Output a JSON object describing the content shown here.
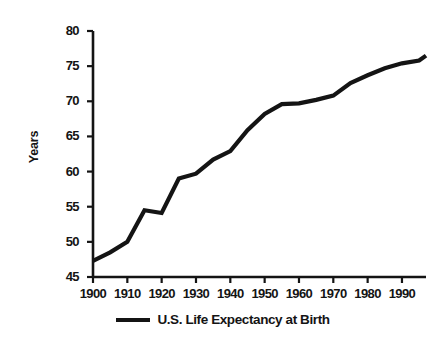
{
  "chart_data": {
    "type": "line",
    "title": "",
    "xlabel": "",
    "ylabel": "Years",
    "xlim": [
      1900,
      1997
    ],
    "ylim": [
      45,
      80
    ],
    "grid": false,
    "legend_position": "bottom-center",
    "x_ticks": [
      "1900",
      "1910",
      "1920",
      "1930",
      "1940",
      "1950",
      "1960",
      "1970",
      "1980",
      "1990"
    ],
    "x_tick_values": [
      1900,
      1910,
      1920,
      1930,
      1940,
      1950,
      1960,
      1970,
      1980,
      1990
    ],
    "y_ticks": [
      "45",
      "50",
      "55",
      "60",
      "65",
      "70",
      "75",
      "80"
    ],
    "y_tick_values": [
      45,
      50,
      55,
      60,
      65,
      70,
      75,
      80
    ],
    "series": [
      {
        "name": "U.S. Life Expectancy at Birth",
        "color": "#141414",
        "x": [
          1900,
          1905,
          1910,
          1915,
          1920,
          1925,
          1930,
          1935,
          1940,
          1945,
          1950,
          1955,
          1960,
          1965,
          1970,
          1975,
          1980,
          1985,
          1990,
          1995,
          1997
        ],
        "values": [
          47.3,
          48.5,
          50.0,
          54.5,
          54.1,
          59.0,
          59.7,
          61.7,
          62.9,
          65.9,
          68.2,
          69.6,
          69.7,
          70.2,
          70.8,
          72.6,
          73.7,
          74.7,
          75.4,
          75.8,
          76.5
        ]
      }
    ]
  },
  "legend": {
    "entries": [
      {
        "label": "U.S. Life Expectancy at Birth",
        "swatch_name": "legend-line-swatch"
      }
    ]
  },
  "axes": {
    "y_axis_title": "Years"
  }
}
